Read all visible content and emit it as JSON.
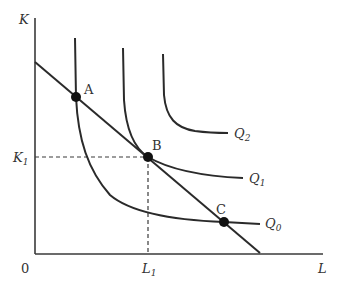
{
  "diagram": {
    "type": "isoquant-isocost",
    "axes": {
      "y_label": "K",
      "x_label": "L",
      "origin_label": "0",
      "y_tick_label": "K",
      "y_tick_sub": "1",
      "x_tick_label": "L",
      "x_tick_sub": "1"
    },
    "isoquants": [
      {
        "name": "Q",
        "sub": "0"
      },
      {
        "name": "Q",
        "sub": "1"
      },
      {
        "name": "Q",
        "sub": "2"
      }
    ],
    "points": [
      {
        "label": "A"
      },
      {
        "label": "B"
      },
      {
        "label": "C"
      }
    ],
    "colors": {
      "line": "#2a2a2a",
      "text": "#333333",
      "background": "#ffffff"
    }
  }
}
